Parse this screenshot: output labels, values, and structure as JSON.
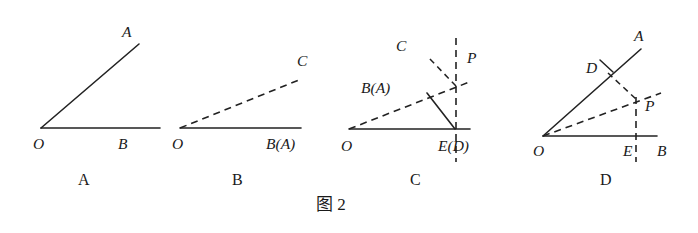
{
  "figure": {
    "caption": "图 2",
    "caption_x": 316,
    "caption_y": 196,
    "background_color": "#ffffff",
    "ink_color": "#222222",
    "width": 698,
    "height": 233
  },
  "panels": [
    {
      "id": "panel-a",
      "label": "A",
      "label_x": 78,
      "label_y": 172,
      "description": "Angle AOB with solid ray OA and solid ray OB",
      "points": [
        {
          "name": "A",
          "text": "A",
          "x": 122,
          "y": 24,
          "style": "italic"
        },
        {
          "name": "O",
          "text": "O",
          "x": 33,
          "y": 136,
          "style": "italic"
        },
        {
          "name": "B",
          "text": "B",
          "x": 118,
          "y": 136,
          "style": "italic"
        }
      ],
      "segments": [
        {
          "name": "ray-OA",
          "kind": "solid",
          "x1": 41,
          "y1": 128,
          "x2": 139,
          "y2": 44
        },
        {
          "name": "ray-OB",
          "kind": "solid",
          "x1": 41,
          "y1": 128,
          "x2": 160,
          "y2": 128
        }
      ]
    },
    {
      "id": "panel-b",
      "label": "B",
      "label_x": 232,
      "label_y": 172,
      "description": "Solid ray O to B(A) with dashed ray OC above it",
      "points": [
        {
          "name": "C",
          "text": "C",
          "x": 297,
          "y": 53,
          "style": "italic"
        },
        {
          "name": "O",
          "text": "O",
          "x": 172,
          "y": 136,
          "style": "italic"
        },
        {
          "name": "B(A)",
          "text": "B(A)",
          "x": 266,
          "y": 136,
          "style": "italic"
        }
      ],
      "segments": [
        {
          "name": "ray-OC",
          "kind": "dashed",
          "x1": 180,
          "y1": 128,
          "x2": 299,
          "y2": 80
        },
        {
          "name": "ray-OB",
          "kind": "solid",
          "x1": 180,
          "y1": 128,
          "x2": 301,
          "y2": 128
        }
      ]
    },
    {
      "id": "panel-c",
      "label": "C",
      "label_x": 410,
      "label_y": 172,
      "description": "Solid ray O to E(D), dashed ray O through P, dashed vertical through E, dashed short ray toward C, solid segment E to fold point",
      "points": [
        {
          "name": "C",
          "text": "C",
          "x": 396,
          "y": 38,
          "style": "italic"
        },
        {
          "name": "P",
          "text": "P",
          "x": 467,
          "y": 50,
          "style": "italic"
        },
        {
          "name": "B(A)",
          "text": "B(A)",
          "x": 361,
          "y": 80,
          "style": "italic"
        },
        {
          "name": "O",
          "text": "O",
          "x": 341,
          "y": 138,
          "style": "italic"
        },
        {
          "name": "E(D)",
          "text": "E(D)",
          "x": 438,
          "y": 138,
          "style": "italic"
        }
      ],
      "segments": [
        {
          "name": "ray-OE",
          "kind": "solid",
          "x1": 349,
          "y1": 129,
          "x2": 470,
          "y2": 129
        },
        {
          "name": "ray-OP",
          "kind": "dashed",
          "x1": 349,
          "y1": 129,
          "x2": 472,
          "y2": 81
        },
        {
          "name": "vertical-PE",
          "kind": "dashed",
          "x1": 456,
          "y1": 38,
          "x2": 456,
          "y2": 162
        },
        {
          "name": "ray-PC",
          "kind": "dashed",
          "x1": 456,
          "y1": 86,
          "x2": 428,
          "y2": 57
        },
        {
          "name": "segment-EF",
          "kind": "solid",
          "x1": 455,
          "y1": 129,
          "x2": 427,
          "y2": 93
        }
      ]
    },
    {
      "id": "panel-d",
      "label": "D",
      "label_x": 600,
      "label_y": 172,
      "description": "Angle AOB with solid rays, dashed ray O through P, dashed perpendicular from D to P, dashed vertical through E",
      "points": [
        {
          "name": "A",
          "text": "A",
          "x": 634,
          "y": 28,
          "style": "italic"
        },
        {
          "name": "D",
          "text": "D",
          "x": 586,
          "y": 60,
          "style": "italic"
        },
        {
          "name": "P",
          "text": "P",
          "x": 645,
          "y": 98,
          "style": "italic"
        },
        {
          "name": "O",
          "text": "O",
          "x": 533,
          "y": 143,
          "style": "italic"
        },
        {
          "name": "E",
          "text": "E",
          "x": 623,
          "y": 143,
          "style": "italic"
        },
        {
          "name": "B",
          "text": "B",
          "x": 657,
          "y": 143,
          "style": "italic"
        }
      ],
      "segments": [
        {
          "name": "ray-OA",
          "kind": "solid",
          "x1": 543,
          "y1": 136,
          "x2": 641,
          "y2": 49
        },
        {
          "name": "ray-OB",
          "kind": "solid",
          "x1": 543,
          "y1": 136,
          "x2": 657,
          "y2": 136
        },
        {
          "name": "ray-OP",
          "kind": "dashed",
          "x1": 543,
          "y1": 136,
          "x2": 661,
          "y2": 93
        },
        {
          "name": "segment-DP",
          "kind": "dashed",
          "x1": 608,
          "y1": 73,
          "x2": 637,
          "y2": 100
        },
        {
          "name": "vertical-PE",
          "kind": "dashed",
          "x1": 636,
          "y1": 97,
          "x2": 636,
          "y2": 162
        },
        {
          "name": "tick-at-D",
          "kind": "tick",
          "x1": 600,
          "y1": 60,
          "x2": 613,
          "y2": 72
        }
      ]
    }
  ]
}
